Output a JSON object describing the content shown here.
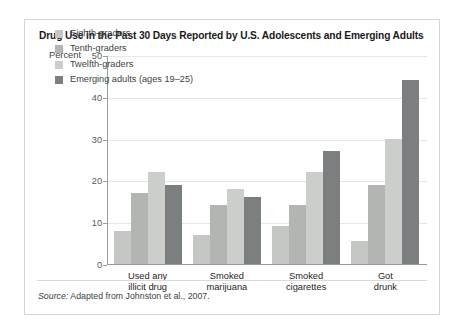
{
  "figure": {
    "title": "Drug Use in the Past 30 Days Reported by U.S. Adolescents and Emerging Adults",
    "axis_label": "Percent",
    "source_prefix": "Source:",
    "source_text": "Adapted from Johnston et al., 2007."
  },
  "chart_data": {
    "type": "bar",
    "title": "Drug Use in the Past 30 Days Reported by U.S. Adolescents and Emerging Adults",
    "xlabel": "",
    "ylabel": "Percent",
    "ylim": [
      0,
      50
    ],
    "yticks": [
      0,
      10,
      20,
      30,
      40,
      50
    ],
    "grid": true,
    "legend_position": "upper-left-inside",
    "categories": [
      "Used any\nillicit drug",
      "Smoked\nmarijuana",
      "Smoked\ncigarettes",
      "Got\ndrunk"
    ],
    "series": [
      {
        "name": "Eighth-graders",
        "color": "#c5c7c5",
        "values": [
          8,
          7,
          9,
          5.5
        ]
      },
      {
        "name": "Tenth-graders",
        "color": "#b3b5b3",
        "values": [
          17,
          14,
          14,
          19
        ]
      },
      {
        "name": "Twelfth-graders",
        "color": "#cccecc",
        "values": [
          22,
          18,
          22,
          30
        ]
      },
      {
        "name": "Emerging adults (ages 19–25)",
        "color": "#7c7f80",
        "values": [
          19,
          16,
          27,
          44
        ]
      }
    ]
  }
}
